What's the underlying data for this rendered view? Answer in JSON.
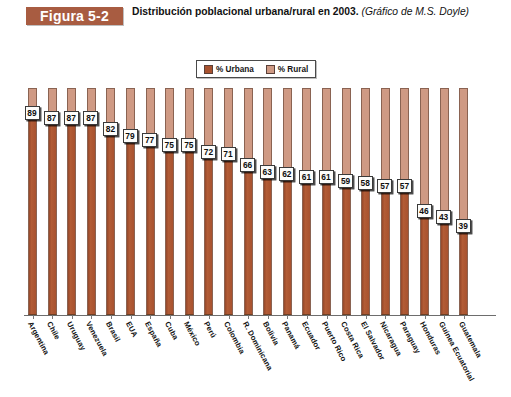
{
  "header": {
    "badge": "Figura 5-2",
    "caption_main": "Distribución poblacional urbana/rural en 2003.",
    "caption_attribution": "(Gráfico de M.S. Doyle)"
  },
  "legend": {
    "entries": [
      {
        "label": "% Urbana",
        "color": "#a8522f"
      },
      {
        "label": "% Rural",
        "color": "#cf9a84"
      }
    ]
  },
  "colors": {
    "urbana": "#a8522f",
    "rural": "#cf9a84",
    "badge": "#a85c41",
    "bar_outline": "#8a6352",
    "background": "#ffffff"
  },
  "chart_data": {
    "type": "bar",
    "title": "Distribución poblacional urbana/rural en 2003.",
    "subtitle": "(Gráfico de M.S. Doyle)",
    "xlabel": "",
    "ylabel": "",
    "ylim": [
      0,
      100
    ],
    "grid": false,
    "stacked": true,
    "legend_position": "top-center",
    "categories": [
      "Argentina",
      "Chile",
      "Uruguay",
      "Venezuela",
      "Brasil",
      "EUA",
      "España",
      "Cuba",
      "México",
      "Perú",
      "Colombia",
      "R. Dominicana",
      "Bolivia",
      "Panamá",
      "Ecuador",
      "Puerto Rico",
      "Costa Rica",
      "El Salvador",
      "Nicaragua",
      "Paraguay",
      "Honduras",
      "Guinea Ecuatorial",
      "Guatemala"
    ],
    "series": [
      {
        "name": "% Urbana",
        "color": "#a8522f",
        "values": [
          89,
          87,
          87,
          87,
          82,
          79,
          77,
          75,
          75,
          72,
          71,
          66,
          63,
          62,
          61,
          61,
          59,
          58,
          57,
          57,
          46,
          43,
          39
        ]
      },
      {
        "name": "% Rural",
        "color": "#cf9a84",
        "values": [
          11,
          13,
          13,
          13,
          18,
          21,
          23,
          25,
          25,
          28,
          29,
          34,
          37,
          38,
          39,
          39,
          41,
          42,
          43,
          43,
          54,
          57,
          61
        ]
      }
    ]
  }
}
